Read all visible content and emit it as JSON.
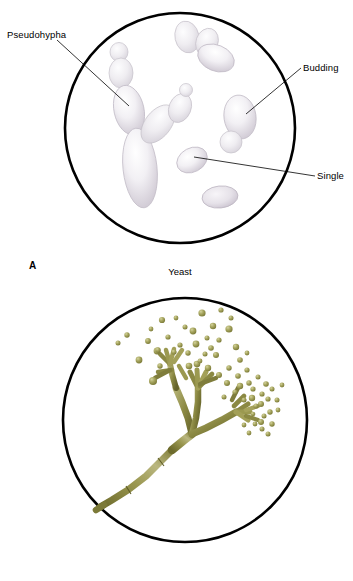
{
  "figure": {
    "background_color": "#ffffff",
    "outline_color": "#000000",
    "label_color": "#000000"
  },
  "panels": [
    {
      "id": "A",
      "panel_letter": "A",
      "caption": "Yeast",
      "circle": {
        "cx": 180,
        "cy": 128,
        "r": 115,
        "stroke_width": 2.6
      },
      "annotations": [
        {
          "name": "pseudohypha",
          "label": "Pseudohypha",
          "leader": {
            "x1": 57,
            "y1": 40,
            "x2": 129,
            "y2": 106
          }
        },
        {
          "name": "budding",
          "label": "Budding",
          "leader": {
            "x1": 301,
            "y1": 68,
            "x2": 246,
            "y2": 114
          }
        },
        {
          "name": "single",
          "label": "Single",
          "leader": {
            "x1": 315,
            "y1": 176,
            "x2": 194,
            "y2": 157
          }
        }
      ],
      "cell_color_fill": "#eceaee",
      "cell_color_edge": "#b9b4bd",
      "cell_count": 13
    },
    {
      "id": "B",
      "panel_letter": "B",
      "caption": "Mold",
      "circle": {
        "cx": 185,
        "cy": 420,
        "r": 122,
        "stroke_width": 2.6
      },
      "annotations": [],
      "hypha_color_dark": "#6e6c2e",
      "hypha_color_mid": "#8c8a45",
      "hypha_color_light": "#b7b478",
      "spore_color": "#9a9a52",
      "spore_highlight": "#c7c68d",
      "spore_count": 58
    }
  ]
}
